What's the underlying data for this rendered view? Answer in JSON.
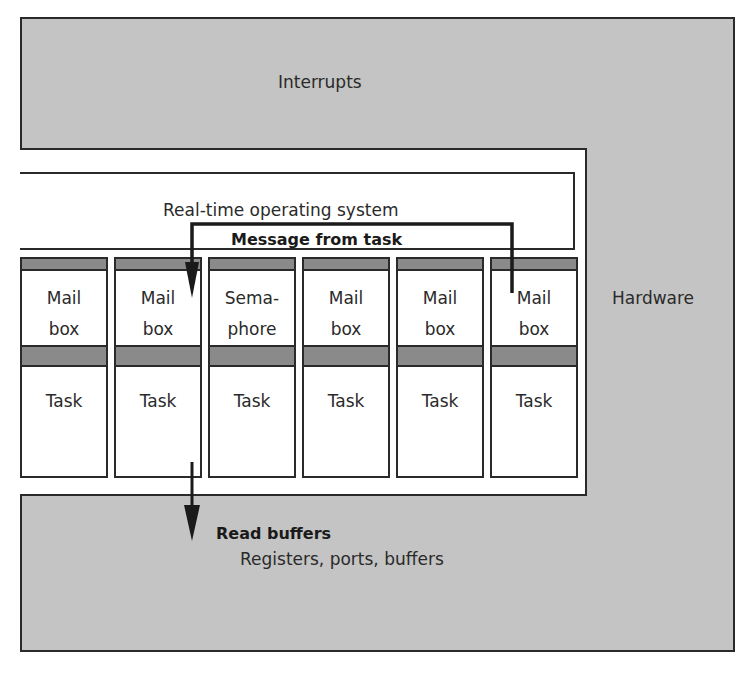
{
  "diagram": {
    "hardware_label": "Hardware",
    "interrupts_label": "Interrupts",
    "rtos_label": "Real-time operating system",
    "message_label": "Message from  task",
    "read_buffers_label": "Read buffers",
    "registers_label": "Registers, ports, buffers",
    "columns": [
      {
        "upper_line1": "Mail",
        "upper_line2": "box",
        "lower": "Task"
      },
      {
        "upper_line1": "Mail",
        "upper_line2": "box",
        "lower": "Task"
      },
      {
        "upper_line1": "Sema-",
        "upper_line2": "phore",
        "lower": "Task"
      },
      {
        "upper_line1": "Mail",
        "upper_line2": "box",
        "lower": "Task"
      },
      {
        "upper_line1": "Mail",
        "upper_line2": "box",
        "lower": "Task"
      },
      {
        "upper_line1": "Mail",
        "upper_line2": "box",
        "lower": "Task"
      }
    ],
    "colors": {
      "hardware_fill": "#c4c4c4",
      "band_fill": "#8a8a8a",
      "line": "#2a2a2a"
    }
  }
}
